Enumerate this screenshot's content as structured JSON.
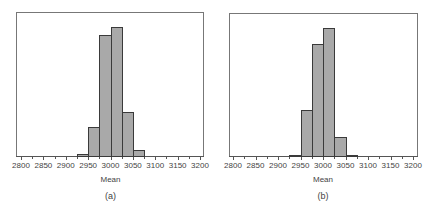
{
  "chart_data": [
    {
      "type": "bar",
      "panel": "(a)",
      "title": "",
      "xlabel": "Mean",
      "ylabel": "",
      "caption": "(a)",
      "xlim": [
        2800,
        3200
      ],
      "x_ticks": [
        2800,
        2850,
        2900,
        2950,
        3000,
        3050,
        3100,
        3150,
        3200
      ],
      "bin_width": 25,
      "bins": [
        {
          "start": 2925,
          "end": 2950,
          "height": 2
        },
        {
          "start": 2950,
          "end": 2975,
          "height": 21
        },
        {
          "start": 2975,
          "end": 3000,
          "height": 85
        },
        {
          "start": 3000,
          "end": 3025,
          "height": 90
        },
        {
          "start": 3025,
          "end": 3050,
          "height": 31
        },
        {
          "start": 3050,
          "end": 3075,
          "height": 5
        }
      ],
      "yaxis_shown": false,
      "grid": false
    },
    {
      "type": "bar",
      "panel": "(b)",
      "title": "",
      "xlabel": "Mean",
      "ylabel": "",
      "caption": "(b)",
      "xlim": [
        2800,
        3200
      ],
      "x_ticks": [
        2800,
        2850,
        2900,
        2950,
        3000,
        3050,
        3100,
        3150,
        3200
      ],
      "bin_width": 25,
      "bins": [
        {
          "start": 2925,
          "end": 2950,
          "height": 1
        },
        {
          "start": 2950,
          "end": 2975,
          "height": 33
        },
        {
          "start": 2975,
          "end": 3000,
          "height": 79
        },
        {
          "start": 3000,
          "end": 3025,
          "height": 90
        },
        {
          "start": 3025,
          "end": 3050,
          "height": 14
        },
        {
          "start": 3050,
          "end": 3075,
          "height": 1
        }
      ],
      "yaxis_shown": false,
      "grid": false
    }
  ],
  "panels": [
    {
      "caption": "(a)",
      "xlabel": "Mean"
    },
    {
      "caption": "(b)",
      "xlabel": "Mean"
    }
  ]
}
